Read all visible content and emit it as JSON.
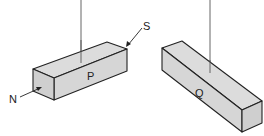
{
  "figure": {
    "colors": {
      "face_light": "#dcdcdc",
      "face_mid": "#d2d2d2",
      "face_dark": "#c8c8c8",
      "stroke": "#222222",
      "thread": "#555555"
    },
    "block_p": {
      "label": "P",
      "end_labels": {
        "north": "N",
        "south": "S"
      }
    },
    "block_q": {
      "label": "Q"
    }
  }
}
